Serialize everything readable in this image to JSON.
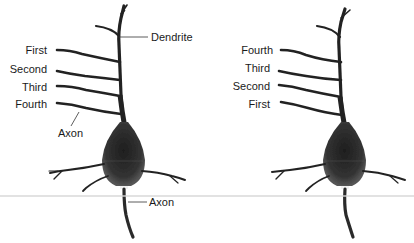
{
  "figure": {
    "colors": {
      "background": "#ffffff",
      "neuron": "#222222",
      "soma": "#2e2e2e",
      "label_text": "#1a1a1a",
      "leader_line": "#333333",
      "divider_line": "#d4d4d4"
    },
    "left_neuron": {
      "dendrite_label": "Dendrite",
      "branch_labels": [
        "First",
        "Second",
        "Third",
        "Fourth"
      ],
      "upper_axon_label": "Axon",
      "lower_axon_label": "Axon"
    },
    "right_neuron": {
      "branch_labels": [
        "Fourth",
        "Third",
        "Second",
        "First"
      ]
    }
  }
}
